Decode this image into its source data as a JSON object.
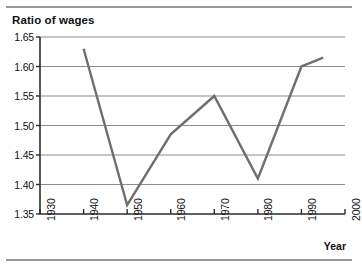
{
  "figure": {
    "ghost_caption": "",
    "title": "Ratio of wages",
    "xaxis_title": "Year"
  },
  "colors": {
    "line": "#6e6e6e",
    "gridline": "#8c8c8c",
    "axis": "#2b2b2b",
    "text": "#111111",
    "background": "#ffffff",
    "rule": "#9a9a9a"
  },
  "chart_data": {
    "type": "line",
    "title": "Ratio of wages",
    "xlabel": "Year",
    "ylabel": "Ratio of wages",
    "x": [
      1940,
      1950,
      1960,
      1970,
      1980,
      1990,
      1995
    ],
    "values": [
      1.63,
      1.365,
      1.485,
      1.55,
      1.41,
      1.6,
      1.615
    ],
    "series": [
      {
        "name": "Ratio of wages",
        "x": [
          1940,
          1950,
          1960,
          1970,
          1980,
          1990,
          1995
        ],
        "values": [
          1.63,
          1.365,
          1.485,
          1.55,
          1.41,
          1.6,
          1.615
        ]
      }
    ],
    "xlim": [
      1930,
      2000
    ],
    "ylim": [
      1.35,
      1.65
    ],
    "xticks": [
      1930,
      1940,
      1950,
      1960,
      1970,
      1980,
      1990,
      2000
    ],
    "xtick_labels": [
      "1930",
      "1940",
      "1950",
      "1960",
      "1970",
      "1980",
      "1990",
      "2000"
    ],
    "yticks": [
      1.35,
      1.4,
      1.45,
      1.5,
      1.55,
      1.6,
      1.65
    ],
    "ytick_labels": [
      "1.35",
      "1.40",
      "1.45",
      "1.50",
      "1.55",
      "1.60",
      "1.65"
    ],
    "grid": "horizontal",
    "legend": "none",
    "markers": false,
    "xtick_label_rotation": -90
  }
}
